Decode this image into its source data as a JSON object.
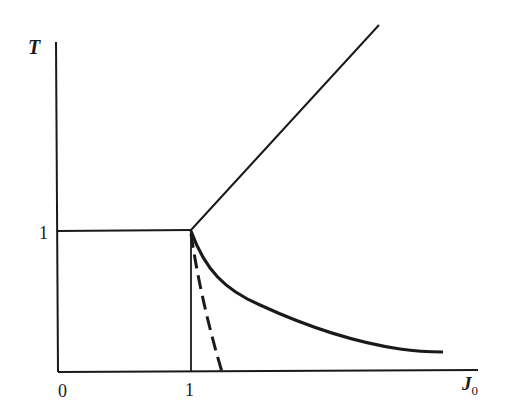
{
  "diagram": {
    "type": "phase diagram",
    "axes": {
      "y_label": "T",
      "x_label": "J",
      "x_label_subscript": "0",
      "origin_label": "0",
      "x_tick_label": "1",
      "y_tick_label": "1"
    },
    "curves": [
      {
        "name": "diagonal-line",
        "style": "solid",
        "description": "straight line rising from (1,1)"
      },
      {
        "name": "horizontal-line",
        "style": "solid",
        "description": "T = 1 from J0 = 0 to 1"
      },
      {
        "name": "vertical-line",
        "style": "solid",
        "description": "J0 = 1 from T = 0 to 1"
      },
      {
        "name": "solid-decaying-curve",
        "style": "solid-thick",
        "description": "decays from (1,1) toward T→0 as J0 increases"
      },
      {
        "name": "dashed-curve",
        "style": "dashed",
        "description": "drops from (1,1) to T = 0 slightly right of J0 = 1"
      }
    ],
    "colors": {
      "line": "#1a1a1a",
      "background": "#ffffff"
    }
  }
}
